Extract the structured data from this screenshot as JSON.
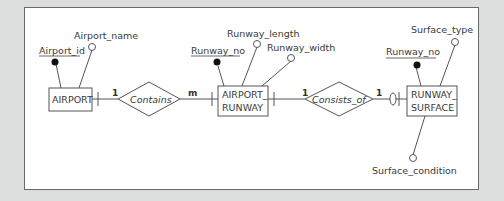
{
  "diagram": {
    "type": "er-diagram",
    "entities": [
      {
        "id": "airport",
        "label": "AIRPORT"
      },
      {
        "id": "airport_runway",
        "label_line1": "AIRPORT_",
        "label_line2": "RUNWAY"
      },
      {
        "id": "runway_surface",
        "label_line1": "RUNWAY_",
        "label_line2": "SURFACE"
      }
    ],
    "relationships": [
      {
        "id": "contains",
        "label": "Contains",
        "card_left": "1",
        "card_right": "m"
      },
      {
        "id": "consists_of",
        "label": "Consists_of",
        "card_left": "1",
        "card_right": "1"
      }
    ],
    "attributes": {
      "airport": {
        "key": "Airport_id",
        "other": [
          "Airport_name"
        ]
      },
      "airport_runway": {
        "key": "Runway_no",
        "other": [
          "Runway_length",
          "Runway_width"
        ]
      },
      "runway_surface": {
        "key": "Runway_no",
        "other": [
          "Surface_type",
          "Surface_condition"
        ]
      }
    },
    "colors": {
      "background": "#dcdedd",
      "panel": "#ffffff",
      "line": "#555555",
      "key_dot": "#111111"
    }
  }
}
